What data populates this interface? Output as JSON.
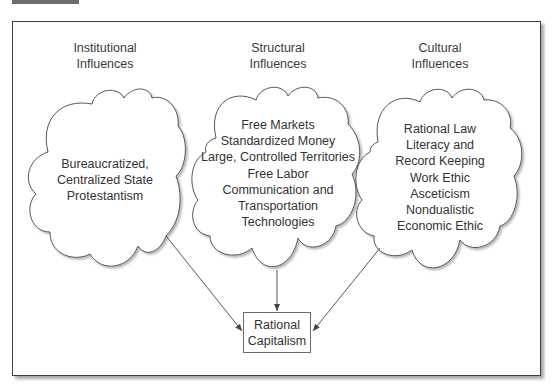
{
  "figure": {
    "columns": [
      {
        "header": [
          "Institutional",
          "Influences"
        ],
        "items": [
          "Bureaucratized,",
          "Centralized State",
          "Protestantism"
        ]
      },
      {
        "header": [
          "Structural",
          "Influences"
        ],
        "items": [
          "Free Markets",
          "Standardized Money",
          "Large, Controlled Territories",
          "Free Labor",
          "Communication and",
          "Transportation",
          "Technologies"
        ]
      },
      {
        "header": [
          "Cultural",
          "Influences"
        ],
        "items": [
          "Rational Law",
          "Literacy and",
          "Record Keeping",
          "Work Ethic",
          "Asceticism",
          "Nondualistic",
          "Economic Ethic"
        ]
      }
    ],
    "outcome": [
      "Rational",
      "Capitalism"
    ]
  },
  "colors": {
    "frame": "#3e3e3e",
    "cloud_stroke": "#555555",
    "text": "#333333",
    "header_tab": "#6d6d6d"
  }
}
